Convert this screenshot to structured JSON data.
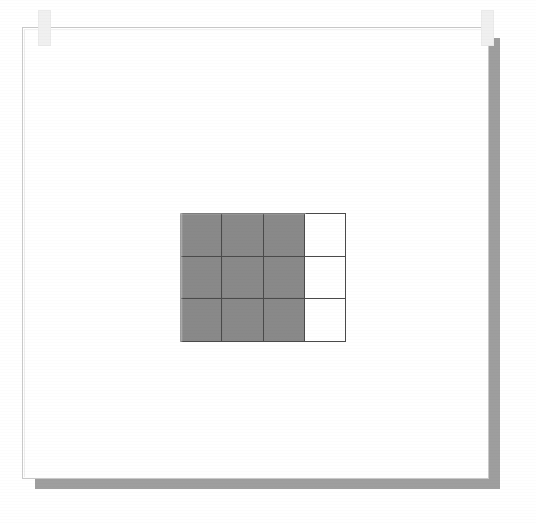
{
  "page": {
    "background_color": "#ffffff",
    "sheet_color": "#ffffff",
    "sheet_border_color": "#c9c9c9",
    "shadow_color": "#9e9e9e",
    "title": ""
  },
  "tabs": [
    {
      "name": "top-left-tab",
      "color": "#f0f0f0"
    },
    {
      "name": "top-right-tab",
      "color": "#f0f0f0"
    }
  ],
  "figure": {
    "type": "fraction-grid",
    "columns": 4,
    "rows": 3,
    "total_cells": 12,
    "shaded_cells": 9,
    "unshaded_cells": 3,
    "fraction_shaded": "9/12",
    "fraction_simplified": "3/4",
    "fill_color": "#8b8b8b",
    "empty_color": "#ffffff",
    "line_color": "#4a4a4a",
    "cells": [
      [
        1,
        1,
        1,
        0
      ],
      [
        1,
        1,
        1,
        0
      ],
      [
        1,
        1,
        1,
        0
      ]
    ]
  }
}
